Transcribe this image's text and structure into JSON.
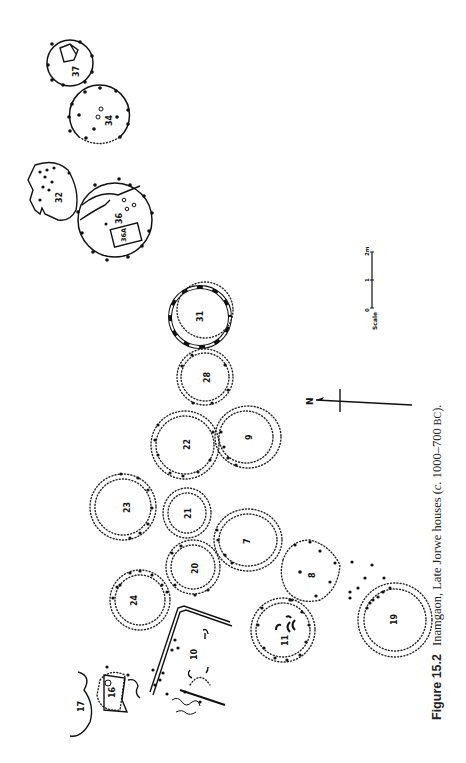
{
  "figure": {
    "label": "Figure 15.2",
    "caption_main": "Inamgaon, Late Jorwe houses (",
    "caption_c": "c.",
    "caption_range": " 1000–700 ",
    "caption_era": "BC",
    "caption_end": ")."
  },
  "north_arrow": {
    "label": "N"
  },
  "scale": {
    "label": "Scale",
    "ticks": [
      "0",
      "1",
      "2m"
    ]
  },
  "houses": [
    {
      "id": "37",
      "cx": 70,
      "cy": 63,
      "r": 23,
      "style": "solid"
    },
    {
      "id": "34",
      "cx": 99,
      "cy": 117,
      "r": 30,
      "style": "solid"
    },
    {
      "id": "32",
      "cx": 52,
      "cy": 192,
      "r": 0,
      "style": "irregular"
    },
    {
      "id": "36",
      "cx": 115,
      "cy": 220,
      "r": 37,
      "style": "solid"
    },
    {
      "id": "36A",
      "cx": 125,
      "cy": 235,
      "r": 0,
      "style": "box"
    },
    {
      "id": "31",
      "cx": 200,
      "cy": 317,
      "r": 30,
      "style": "wall"
    },
    {
      "id": "28",
      "cx": 205,
      "cy": 377,
      "r": 28,
      "style": "double-dotted"
    },
    {
      "id": "22",
      "cx": 185,
      "cy": 445,
      "r": 33,
      "style": "double-dotted"
    },
    {
      "id": "9",
      "cx": 248,
      "cy": 437,
      "r": 31,
      "style": "double-dotted"
    },
    {
      "id": "23",
      "cx": 127,
      "cy": 507,
      "r": 32,
      "style": "double-dotted"
    },
    {
      "id": "21",
      "cx": 187,
      "cy": 513,
      "r": 24,
      "style": "double-dotted"
    },
    {
      "id": "7",
      "cx": 247,
      "cy": 540,
      "r": 30,
      "style": "double-dotted"
    },
    {
      "id": "20",
      "cx": 193,
      "cy": 567,
      "r": 26,
      "style": "double-dotted"
    },
    {
      "id": "24",
      "cx": 133,
      "cy": 600,
      "r": 28,
      "style": "double-dotted"
    },
    {
      "id": "8",
      "cx": 310,
      "cy": 572,
      "r": 32,
      "style": "dotted"
    },
    {
      "id": "11",
      "cx": 283,
      "cy": 630,
      "r": 32,
      "style": "double-dotted"
    },
    {
      "id": "19",
      "cx": 393,
      "cy": 618,
      "r": 36,
      "style": "double-dotted"
    },
    {
      "id": "10",
      "cx": 195,
      "cy": 655,
      "r": 0,
      "style": "walled-area"
    },
    {
      "id": "16",
      "cx": 110,
      "cy": 695,
      "r": 0,
      "style": "irregular"
    },
    {
      "id": "17",
      "cx": 82,
      "cy": 705,
      "r": 0,
      "style": "arc"
    }
  ],
  "colors": {
    "ink": "#111111",
    "paper": "#ffffff"
  }
}
